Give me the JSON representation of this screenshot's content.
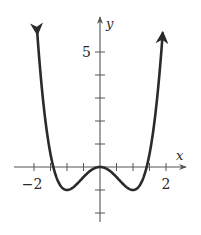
{
  "chart_data": {
    "type": "line",
    "title": "",
    "function": "y = x^4 - 2x^2",
    "xlabel": "x",
    "ylabel": "y",
    "xlim": [
      -2.2,
      2.2
    ],
    "ylim": [
      -2.2,
      6.2
    ],
    "grid": false,
    "legend": null,
    "x_tick_labels": [
      {
        "value": -2,
        "label": "−2"
      },
      {
        "value": 2,
        "label": "2"
      }
    ],
    "y_tick_labels": [
      {
        "value": 5,
        "label": "5"
      }
    ],
    "x_ticks": [
      -2,
      -1.5,
      -1,
      -0.5,
      0.5,
      1,
      1.5,
      2
    ],
    "y_ticks": [
      -2,
      -1,
      1,
      2,
      3,
      4,
      5
    ],
    "series": [
      {
        "name": "f(x)",
        "x": [
          -1.9,
          -1.8,
          -1.7,
          -1.6,
          -1.5,
          -1.4,
          -1.3,
          -1.2,
          -1.1,
          -1.0,
          -0.9,
          -0.8,
          -0.7,
          -0.6,
          -0.5,
          -0.4,
          -0.3,
          -0.2,
          -0.1,
          0.0,
          0.1,
          0.2,
          0.3,
          0.4,
          0.5,
          0.6,
          0.7,
          0.8,
          0.9,
          1.0,
          1.1,
          1.2,
          1.3,
          1.4,
          1.5,
          1.6,
          1.7,
          1.8,
          1.9
        ],
        "values": [
          5.81,
          4.02,
          2.57,
          1.43,
          0.56,
          -0.08,
          -0.52,
          -0.81,
          -0.96,
          -1.0,
          -0.96,
          -0.87,
          -0.74,
          -0.59,
          -0.44,
          -0.29,
          -0.17,
          -0.08,
          -0.02,
          0.0,
          -0.02,
          -0.08,
          -0.17,
          -0.29,
          -0.44,
          -0.59,
          -0.74,
          -0.87,
          -0.96,
          -1.0,
          -0.96,
          -0.81,
          -0.52,
          -0.08,
          0.56,
          1.43,
          2.57,
          4.02,
          5.81
        ],
        "arrows_at_ends": true,
        "color": "#2a2a2a"
      }
    ],
    "key_points": {
      "local_max": [
        0,
        0
      ],
      "local_min": [
        [
          -1,
          -1
        ],
        [
          1,
          -1
        ]
      ],
      "x_intercepts": [
        -1.414,
        0,
        1.414
      ]
    }
  },
  "axes": {
    "x_label": "x",
    "y_label": "y",
    "color": "#555555"
  }
}
